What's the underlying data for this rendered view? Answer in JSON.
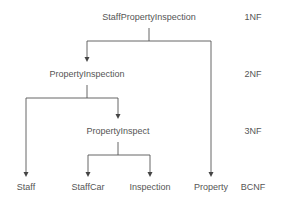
{
  "diagram": {
    "nodes": {
      "root": "StaffPropertyInspection",
      "l2": "PropertyInspection",
      "l3": "PropertyInspect",
      "staff": "Staff",
      "staffcar": "StaffCar",
      "inspection": "Inspection",
      "property": "Property"
    },
    "levels": {
      "nf1": "1NF",
      "nf2": "2NF",
      "nf3": "3NF",
      "bcnf": "BCNF"
    },
    "colors": {
      "text": "#555555",
      "line": "#555555"
    }
  }
}
